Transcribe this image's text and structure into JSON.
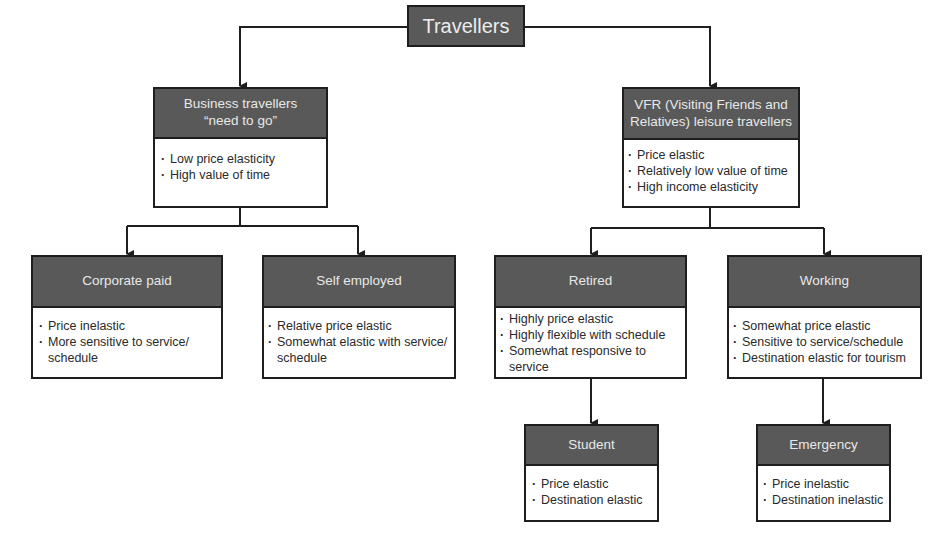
{
  "root": {
    "label": "Travellers"
  },
  "colors": {
    "header_fill": "#595959",
    "header_text": "#e8e8e8",
    "border": "#1e1e1e",
    "body_text": "#2a2a2a"
  },
  "nodes": {
    "business": {
      "title_line1": "Business travellers",
      "title_line2": "“need to go”",
      "bullets": [
        "Low price elasticity",
        "High value of time"
      ]
    },
    "vfr": {
      "title_line1": "VFR (Visiting Friends and",
      "title_line2": "Relatives) leisure travellers",
      "bullets": [
        "Price elastic",
        "Relatively low value of time",
        "High income elasticity"
      ]
    },
    "corporate": {
      "title": "Corporate paid",
      "bullets": [
        "Price inelastic",
        "More sensitive to service/ schedule"
      ]
    },
    "self_employed": {
      "title": "Self employed",
      "bullets": [
        "Relative price elastic",
        "Somewhat elastic with service/ schedule"
      ]
    },
    "retired": {
      "title": "Retired",
      "bullets": [
        "Highly price elastic",
        "Highly flexible with schedule",
        "Somewhat responsive to service"
      ]
    },
    "working": {
      "title": "Working",
      "bullets": [
        "Somewhat price elastic",
        "Sensitive to service/schedule",
        "Destination elastic for tourism"
      ]
    },
    "student": {
      "title": "Student",
      "bullets": [
        "Price elastic",
        "Destination elastic"
      ]
    },
    "emergency": {
      "title": "Emergency",
      "bullets": [
        "Price inelastic",
        "Destination inelastic"
      ]
    }
  }
}
